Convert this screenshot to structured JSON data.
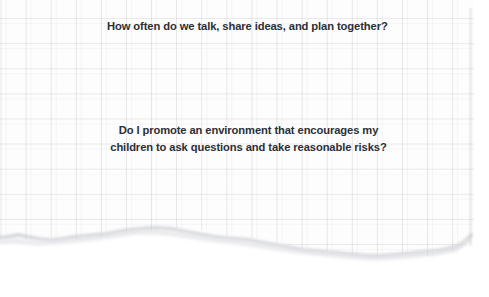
{
  "document": {
    "type": "torn-grid-paper-note",
    "background_color": "#ffffff",
    "paper_color": "#fdfdfd",
    "grid_line_color": "#96969b",
    "text_color": "#2b2f36",
    "cut_text_color": "#c9ccd2"
  },
  "content": {
    "cut_off_line": "and listen to what is important to them?",
    "question_1": "How often do we talk, share ideas, and plan together?",
    "question_2_line_1": "Do I promote an environment that encourages my",
    "question_2_line_2": "children to ask questions and take reasonable risks?"
  }
}
